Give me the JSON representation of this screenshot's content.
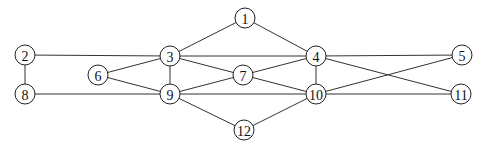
{
  "graph": {
    "node_radius": 10,
    "nodes": [
      {
        "id": "1",
        "label": "1",
        "x": 245,
        "y": 18
      },
      {
        "id": "2",
        "label": "2",
        "x": 25,
        "y": 55
      },
      {
        "id": "3",
        "label": "3",
        "x": 170,
        "y": 56
      },
      {
        "id": "4",
        "label": "4",
        "x": 316,
        "y": 56
      },
      {
        "id": "5",
        "label": "5",
        "x": 462,
        "y": 55
      },
      {
        "id": "6",
        "label": "6",
        "x": 98,
        "y": 75
      },
      {
        "id": "7",
        "label": "7",
        "x": 243,
        "y": 75
      },
      {
        "id": "8",
        "label": "8",
        "x": 25,
        "y": 94
      },
      {
        "id": "9",
        "label": "9",
        "x": 170,
        "y": 94
      },
      {
        "id": "10",
        "label": "10",
        "x": 316,
        "y": 94
      },
      {
        "id": "11",
        "label": "11",
        "x": 461,
        "y": 94
      },
      {
        "id": "12",
        "label": "12",
        "x": 244,
        "y": 130
      }
    ],
    "edges": [
      [
        "1",
        "3"
      ],
      [
        "1",
        "4"
      ],
      [
        "2",
        "3"
      ],
      [
        "2",
        "8"
      ],
      [
        "3",
        "4"
      ],
      [
        "3",
        "6"
      ],
      [
        "3",
        "7"
      ],
      [
        "3",
        "9"
      ],
      [
        "6",
        "9"
      ],
      [
        "7",
        "9"
      ],
      [
        "8",
        "9"
      ],
      [
        "9",
        "10"
      ],
      [
        "9",
        "12"
      ],
      [
        "4",
        "7"
      ],
      [
        "4",
        "5"
      ],
      [
        "4",
        "10"
      ],
      [
        "4",
        "11"
      ],
      [
        "7",
        "10"
      ],
      [
        "10",
        "5"
      ],
      [
        "10",
        "11"
      ],
      [
        "10",
        "12"
      ]
    ]
  }
}
